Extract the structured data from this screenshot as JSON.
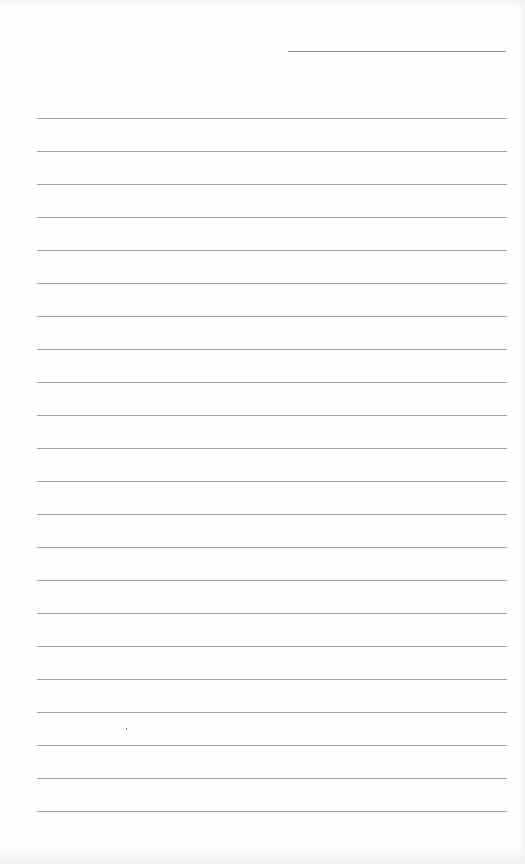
{
  "document": {
    "type": "lined-paper",
    "date_line": {
      "value": ""
    },
    "ruled_lines": {
      "count": 22,
      "first_y": 118,
      "spacing": 33,
      "values": [
        "",
        "",
        "",
        "",
        "",
        "",
        "",
        "",
        "",
        "",
        "",
        "",
        "",
        "",
        "",
        "",
        "",
        "",
        "",
        "",
        "",
        ""
      ]
    },
    "colors": {
      "paper": "#fefefe",
      "rule": "#a3a3a3",
      "date_rule": "#8a8a8a"
    }
  }
}
